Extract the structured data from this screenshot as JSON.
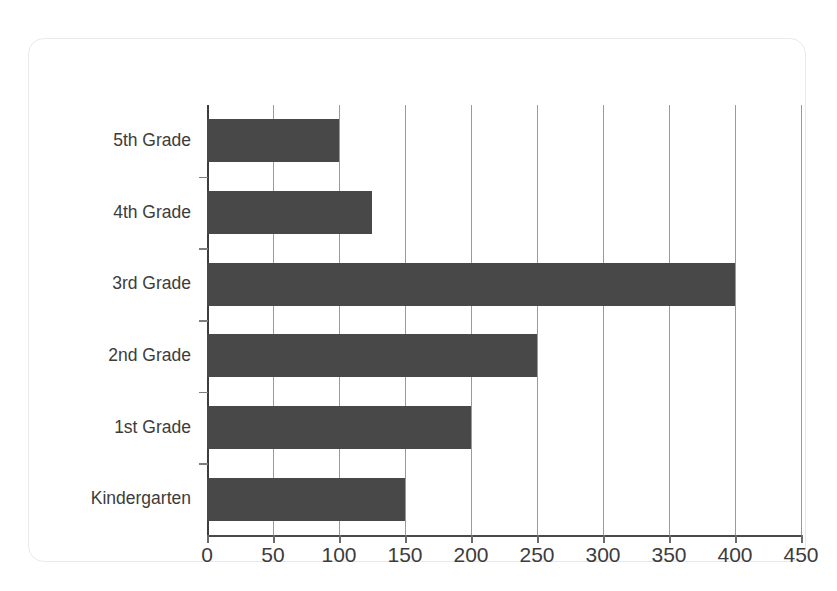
{
  "chart_data": {
    "type": "bar",
    "orientation": "horizontal",
    "title": "",
    "xlabel": "",
    "ylabel": "",
    "categories": [
      "Kindergarten",
      "1st Grade",
      "2nd Grade",
      "3rd Grade",
      "4th Grade",
      "5th Grade"
    ],
    "values": [
      150,
      200,
      250,
      400,
      125,
      100
    ],
    "xlim": [
      0,
      450
    ],
    "xticks": [
      0,
      50,
      100,
      150,
      200,
      250,
      300,
      350,
      400,
      450
    ],
    "xtick_labels": [
      "0",
      "50",
      "100",
      "150",
      "200",
      "250",
      "300",
      "350",
      "400",
      "450"
    ],
    "grid": "vertical",
    "legend": "none",
    "bar_color": "#484848",
    "gridline_color": "#9a9a9a",
    "axis_color": "#3d3d3d",
    "label_color": "#3c3c3c",
    "frame_color": "#e9e9e9",
    "background_color": "#ffffff"
  }
}
